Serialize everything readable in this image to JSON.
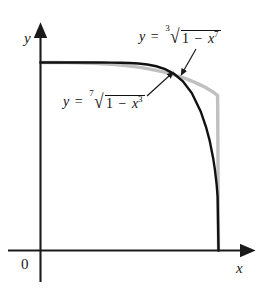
{
  "figure": {
    "name": "two-superellipse-curves-plot",
    "background_color": "#ffffff"
  },
  "axes": {
    "x_label": "x",
    "y_label": "y",
    "origin_label": "0",
    "axis_color": "#1a1a1a"
  },
  "labels": {
    "upper": {
      "lhs": "y",
      "equals": "=",
      "index": "3",
      "surd": "√",
      "one": "1",
      "minus": "−",
      "var": "x",
      "exponent": "7",
      "full_text": "y = cuberoot(1 - x^7)"
    },
    "lower": {
      "lhs": "y",
      "equals": "=",
      "index": "7",
      "surd": "√",
      "one": "1",
      "minus": "−",
      "var": "x",
      "exponent": "3",
      "full_text": "y = 7th-root(1 - x^3)"
    }
  },
  "chart_data": {
    "type": "line",
    "title": "",
    "xlabel": "x",
    "ylabel": "y",
    "xlim": [
      0,
      1.16
    ],
    "ylim": [
      0,
      1.22
    ],
    "grid": false,
    "legend": "annotation-labels-with-leader-arrows",
    "series": [
      {
        "name": "y = (1 - x^7)^(1/3)",
        "color": "#111111",
        "width_px": 2.4,
        "equation": "y = cuberoot(1 - x^7)",
        "x": [
          0,
          0.05,
          0.1,
          0.15,
          0.2,
          0.25,
          0.3,
          0.35,
          0.4,
          0.45,
          0.5,
          0.55,
          0.6,
          0.65,
          0.7,
          0.75,
          0.8,
          0.85,
          0.9,
          0.93,
          0.95,
          0.97,
          0.98,
          0.99,
          0.995,
          1.0
        ],
        "y": [
          1.0,
          1.0,
          1.0,
          1.0,
          1.0,
          1.0,
          0.9999,
          0.9998,
          0.9995,
          0.9988,
          0.9974,
          0.9945,
          0.9893,
          0.9801,
          0.9647,
          0.9397,
          0.9,
          0.8375,
          0.7396,
          0.6569,
          0.5858,
          0.4913,
          0.4291,
          0.3461,
          0.2852,
          0.0
        ]
      },
      {
        "name": "y = (1 - x^3)^(1/7)",
        "color": "#c0c0c0",
        "width_px": 3.4,
        "equation": "y = 7th-root(1 - x^3)",
        "x": [
          0,
          0.05,
          0.1,
          0.15,
          0.2,
          0.25,
          0.3,
          0.35,
          0.4,
          0.45,
          0.5,
          0.55,
          0.6,
          0.65,
          0.7,
          0.75,
          0.8,
          0.85,
          0.9,
          0.93,
          0.95,
          0.97,
          0.98,
          0.99,
          0.995,
          1.0
        ],
        "y": [
          1.0,
          1.0,
          0.9999,
          0.9995,
          0.9989,
          0.9977,
          0.9961,
          0.9937,
          0.9906,
          0.9865,
          0.9814,
          0.9751,
          0.9675,
          0.9583,
          0.9474,
          0.9345,
          0.9192,
          0.9012,
          0.8798,
          0.8651,
          0.8542,
          0.8421,
          0.8354,
          0.8281,
          0.8241,
          0.0
        ]
      }
    ],
    "annotations": [
      {
        "text": "y = cuberoot(1 - x^7)",
        "points_to": "black-curve-shoulder",
        "arrow": "down-left"
      },
      {
        "text": "y = 7th-root(1 - x^3)",
        "points_to": "gray-curve-shoulder",
        "arrow": "up-right"
      }
    ]
  }
}
